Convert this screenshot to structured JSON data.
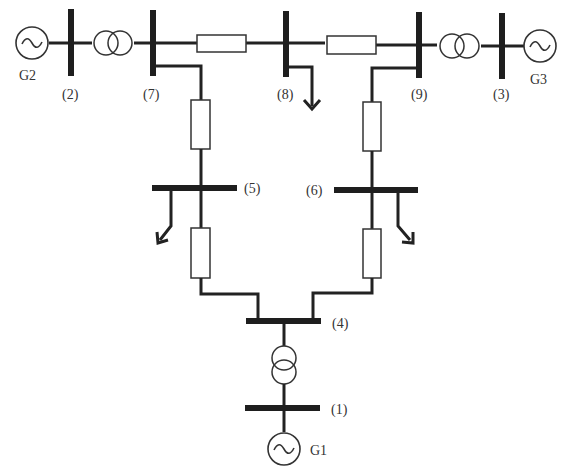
{
  "diagram": {
    "colors": {
      "line": "#222222",
      "bus": "#1e1e1e",
      "background": "#ffffff",
      "label": "#333333"
    },
    "generators": [
      {
        "id": "G2",
        "label": "G2",
        "bus": "2"
      },
      {
        "id": "G3",
        "label": "G3",
        "bus": "3"
      },
      {
        "id": "G1",
        "label": "G1",
        "bus": "1"
      }
    ],
    "buses": [
      {
        "id": "1",
        "label": "(1)"
      },
      {
        "id": "2",
        "label": "(2)"
      },
      {
        "id": "3",
        "label": "(3)"
      },
      {
        "id": "4",
        "label": "(4)"
      },
      {
        "id": "5",
        "label": "(5)"
      },
      {
        "id": "6",
        "label": "(6)"
      },
      {
        "id": "7",
        "label": "(7)"
      },
      {
        "id": "8",
        "label": "(8)"
      },
      {
        "id": "9",
        "label": "(9)"
      }
    ],
    "transformers": [
      {
        "from": "2",
        "to": "7"
      },
      {
        "from": "9",
        "to": "3"
      },
      {
        "from": "4",
        "to": "1"
      }
    ],
    "lines": [
      {
        "from": "7",
        "to": "8"
      },
      {
        "from": "8",
        "to": "9"
      },
      {
        "from": "7",
        "to": "5"
      },
      {
        "from": "9",
        "to": "6"
      },
      {
        "from": "5",
        "to": "4"
      },
      {
        "from": "6",
        "to": "4"
      }
    ],
    "loads": [
      {
        "bus": "8",
        "icon": "load-arrow-icon"
      },
      {
        "bus": "5",
        "icon": "load-arrow-icon"
      },
      {
        "bus": "6",
        "icon": "load-arrow-icon"
      }
    ]
  }
}
